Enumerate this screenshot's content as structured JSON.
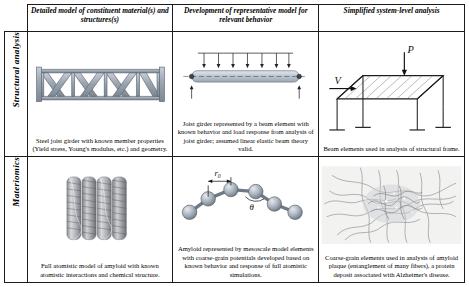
{
  "figure": {
    "columns": [
      {
        "label": "Detailed model of constituent material(s) and structures(s)"
      },
      {
        "label": "Development of representative model for relevant behavior"
      },
      {
        "label": "Simplified system-level analysis"
      }
    ],
    "rows": [
      {
        "label": "Structural analysis"
      },
      {
        "label": "Materiomics"
      }
    ],
    "cells": [
      {
        "row": "Structural analysis",
        "column": "Detailed model of constituent material(s) and structures(s)",
        "caption": "Steel joist girder with known member properties (Yield stress, Young's modulus, etc.) and geometry.",
        "graphic": "steel-truss-girder"
      },
      {
        "row": "Structural analysis",
        "column": "Development of representative model for relevant behavior",
        "caption": "Joist girder represented by a beam element with known behavior and load response from analysis of joist girder; assumed linear elastic beam theory valid.",
        "graphic": "beam-element-with-loads"
      },
      {
        "row": "Structural analysis",
        "column": "Simplified system-level analysis",
        "caption": "Beam elements used in analysis of structural frame.",
        "graphic": "structural-frame",
        "annotations": [
          "P",
          "V"
        ]
      },
      {
        "row": "Materiomics",
        "column": "Detailed model of constituent material(s) and structures(s)",
        "caption": "Full atomistic model of amyloid with known atomistic interactions and chemical structure.",
        "graphic": "amyloid-fibril-atomistic"
      },
      {
        "row": "Materiomics",
        "column": "Development of representative model for relevant behavior",
        "caption": "Amyloid represented by mesoscale model elements with coarse-grain potentials developed based on known behavior and response of full atomistic simulations.",
        "graphic": "coarse-grain-bead-spring",
        "annotations": [
          "r0",
          "θ"
        ]
      },
      {
        "row": "Materiomics",
        "column": "Simplified system-level analysis",
        "caption": "Coarse-grain elements used in analysis of amyloid plaque (entanglement of many fibers), a protein deposit associated with Alzheimer's disease.",
        "graphic": "amyloid-plaque-network"
      }
    ],
    "colors": {
      "border": "#1b1b1b",
      "steel": "#8d9aa6",
      "beam": "#b9c4cf",
      "bead": "#9aa7b4",
      "annotation": "#111111",
      "background": "#ffffff"
    }
  }
}
